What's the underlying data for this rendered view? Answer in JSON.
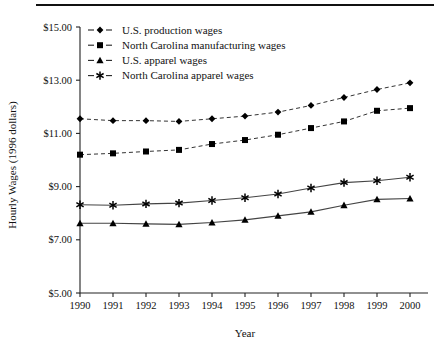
{
  "chart_data": {
    "type": "line",
    "title": "",
    "xlabel": "Year",
    "ylabel": "Hourly Wages (1996 dollars)",
    "x": [
      1990,
      1991,
      1992,
      1993,
      1994,
      1995,
      1996,
      1997,
      1998,
      1999,
      2000
    ],
    "xticklabels": [
      "1990",
      "1991",
      "1992",
      "1993",
      "1994",
      "1995",
      "1996",
      "1997",
      "1998",
      "1999",
      "2000"
    ],
    "yticklabels": [
      "$5.00",
      "$7.00",
      "$9.00",
      "$11.00",
      "$13.00",
      "$15.00"
    ],
    "yticks": [
      5.0,
      7.0,
      9.0,
      11.0,
      13.0,
      15.0
    ],
    "xlim": [
      1990,
      2000
    ],
    "ylim": [
      5.0,
      15.0
    ],
    "grid": false,
    "legend_position": "top-left-inside",
    "series": [
      {
        "name": "U.S. production wages",
        "marker": "diamond",
        "linestyle": "dashed",
        "color": "#000000",
        "values": [
          11.55,
          11.48,
          11.48,
          11.45,
          11.55,
          11.65,
          11.8,
          12.05,
          12.35,
          12.65,
          12.9
        ]
      },
      {
        "name": "North Carolina manufacturing wages",
        "marker": "square",
        "linestyle": "dashed",
        "color": "#000000",
        "values": [
          10.2,
          10.25,
          10.32,
          10.38,
          10.6,
          10.75,
          10.95,
          11.2,
          11.45,
          11.85,
          11.95
        ]
      },
      {
        "name": "U.S. apparel wages",
        "marker": "triangle",
        "linestyle": "solid",
        "color": "#000000",
        "values": [
          7.62,
          7.62,
          7.6,
          7.58,
          7.65,
          7.75,
          7.9,
          8.05,
          8.3,
          8.52,
          8.55
        ]
      },
      {
        "name": "North Carolina apparel wages",
        "marker": "asterisk",
        "linestyle": "solid",
        "color": "#000000",
        "values": [
          8.32,
          8.3,
          8.35,
          8.38,
          8.48,
          8.58,
          8.72,
          8.95,
          9.15,
          9.22,
          9.35
        ]
      }
    ]
  },
  "legend": {
    "items": [
      {
        "label": "U.S. production wages",
        "marker": "diamond"
      },
      {
        "label": "North Carolina manufacturing wages",
        "marker": "square"
      },
      {
        "label": "U.S. apparel wages",
        "marker": "triangle"
      },
      {
        "label": "North Carolina apparel wages",
        "marker": "asterisk"
      }
    ]
  },
  "axes": {
    "y_title": "Hourly Wages (1996 dollars)",
    "x_title": "Year"
  }
}
